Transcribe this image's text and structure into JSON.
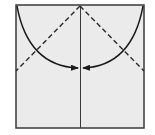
{
  "diagram": {
    "type": "origami-fold-instruction",
    "paper_color": "#ebebeb",
    "line_color": "#2a2a2a",
    "elements": [
      {
        "name": "paper-square"
      },
      {
        "name": "center-crease",
        "style": "solid"
      },
      {
        "name": "valley-fold-left",
        "style": "dashed"
      },
      {
        "name": "valley-fold-right",
        "style": "dashed"
      },
      {
        "name": "fold-arrow-left",
        "direction": "toward-center"
      },
      {
        "name": "fold-arrow-right",
        "direction": "toward-center"
      }
    ]
  }
}
